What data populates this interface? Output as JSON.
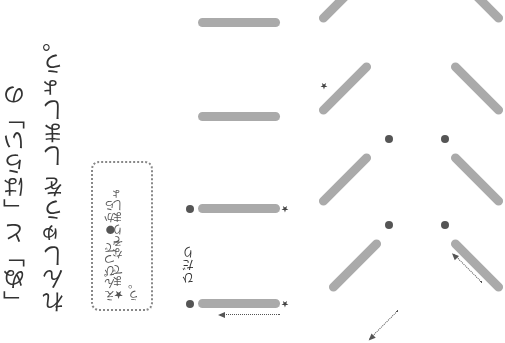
{
  "instructions": {
    "line1": "「ぬ」と「はらい」の",
    "line2": "れんしゅうを しましょう。"
  },
  "hint_box": {
    "line1": "えんぴつで ●から",
    "line2": "★まで なぞりましょう。"
  },
  "labels": {
    "left": "ひだり"
  },
  "markers": {
    "start": "●",
    "end": "★"
  },
  "colors": {
    "stroke": "#aaaaaa",
    "dot": "#555555",
    "text": "#333333"
  }
}
